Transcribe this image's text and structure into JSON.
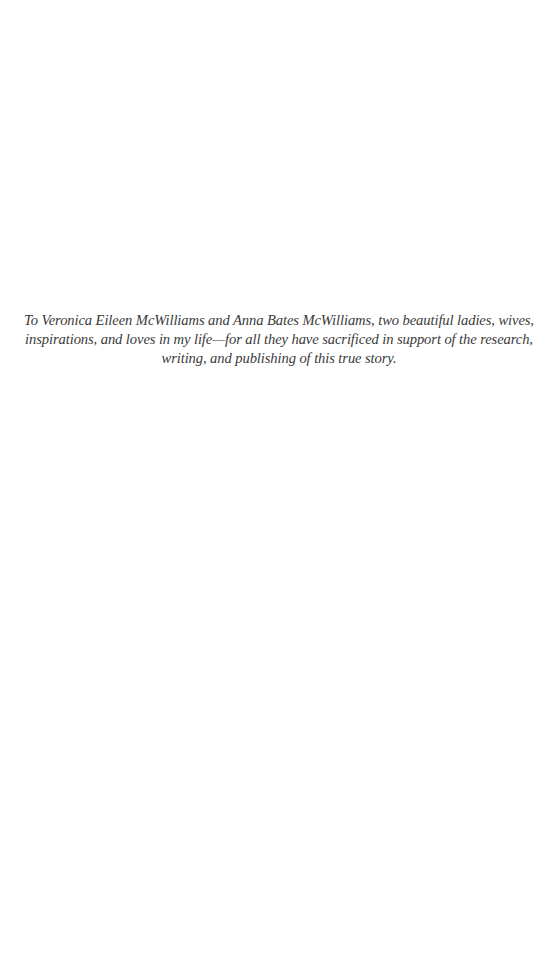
{
  "page": {
    "background": "#ffffff",
    "text_color": "#3a3a3a"
  },
  "dedication": {
    "lines": [
      "To Veronica Eileen McWilliams and Anna Bates McWilliams, two beautiful ladies, wives,",
      "inspirations, and loves in my life—for all they have sacrificed in support of the research,",
      "writing, and publishing of this true story."
    ]
  }
}
